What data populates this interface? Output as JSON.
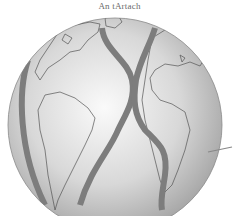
{
  "figure": {
    "title": "An tArtach",
    "colors": {
      "background": "#ffffff",
      "globe_light": "#f2f2f2",
      "globe_dark": "#9a9a9a",
      "coastline": "#5a5a5a",
      "arrow": "#7d7d7d"
    }
  }
}
